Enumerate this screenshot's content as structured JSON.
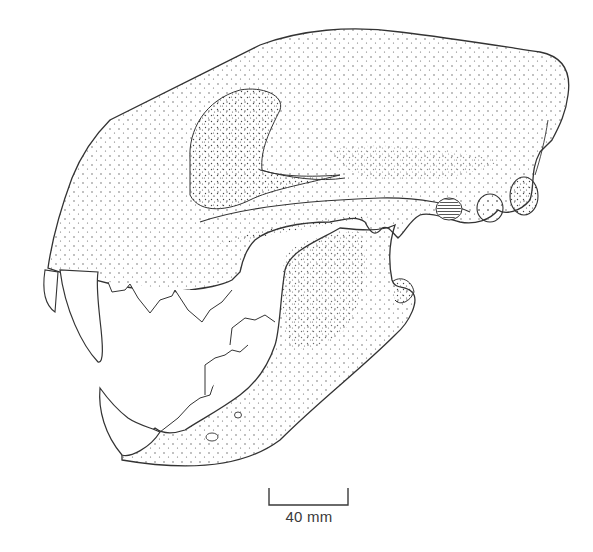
{
  "figure": {
    "style": "stippled line drawing",
    "colors": {
      "background": "#ffffff",
      "ink": "#3a3a3a",
      "stipple": "#4a4a4a"
    },
    "scale_bar": {
      "label": "40 mm",
      "x_start": 268,
      "x_end": 348,
      "y": 505
    }
  }
}
